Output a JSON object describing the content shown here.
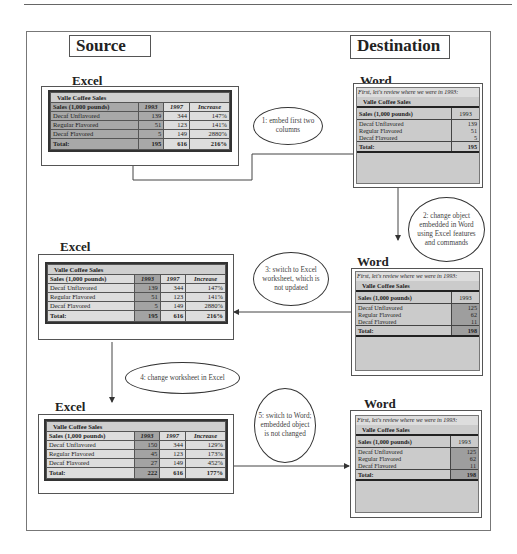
{
  "headers": {
    "source": "Source",
    "destination": "Destination"
  },
  "app_labels": {
    "excel": "Excel",
    "word": "Word"
  },
  "table_title": "Valle Coffee Sales",
  "word_intro": "First, let's review where we were in 1993:",
  "columns": {
    "label": "Sales (1,000 pounds)",
    "y1993": "1993",
    "y1997": "1997",
    "increase": "Increase"
  },
  "total_label": "Total:",
  "excel_tables": [
    {
      "id": "excel-original",
      "rows": [
        {
          "label": "Decaf Unflavored",
          "y1993": "139",
          "y1997": "344",
          "increase": "147%"
        },
        {
          "label": "Regular Flavored",
          "y1993": "51",
          "y1997": "123",
          "increase": "141%"
        },
        {
          "label": "Decaf Flavored",
          "y1993": "5",
          "y1997": "149",
          "increase": "2880%"
        }
      ],
      "total": {
        "y1993": "195",
        "y1997": "616",
        "increase": "216%"
      }
    },
    {
      "id": "excel-not-updated",
      "rows": [
        {
          "label": "Decaf Unflavored",
          "y1993": "139",
          "y1997": "344",
          "increase": "147%"
        },
        {
          "label": "Regular Flavored",
          "y1993": "51",
          "y1997": "123",
          "increase": "141%"
        },
        {
          "label": "Decaf Flavored",
          "y1993": "5",
          "y1997": "149",
          "increase": "2880%"
        }
      ],
      "total": {
        "y1993": "195",
        "y1997": "616",
        "increase": "216%"
      }
    },
    {
      "id": "excel-changed",
      "rows": [
        {
          "label": "Decaf Unflavored",
          "y1993": "150",
          "y1997": "344",
          "increase": "129%"
        },
        {
          "label": "Regular Flavored",
          "y1993": "45",
          "y1997": "123",
          "increase": "173%"
        },
        {
          "label": "Decaf Flavored",
          "y1993": "27",
          "y1997": "149",
          "increase": "452%"
        }
      ],
      "total": {
        "y1993": "222",
        "y1997": "616",
        "increase": "177%"
      }
    }
  ],
  "word_tables": [
    {
      "id": "word-embedded",
      "rows": [
        {
          "label": "Decaf Unflavored",
          "y1993": "139"
        },
        {
          "label": "Regular Flavored",
          "y1993": "51"
        },
        {
          "label": "Decaf Flavored",
          "y1993": "5"
        }
      ],
      "total": "195"
    },
    {
      "id": "word-changed",
      "rows": [
        {
          "label": "Decaf Unflavored",
          "y1993": "125"
        },
        {
          "label": "Regular Flavored",
          "y1993": "62"
        },
        {
          "label": "Decaf Flavored",
          "y1993": "11"
        }
      ],
      "total": "198"
    },
    {
      "id": "word-unchanged",
      "rows": [
        {
          "label": "Decaf Unflavored",
          "y1993": "125"
        },
        {
          "label": "Regular Flavored",
          "y1993": "62"
        },
        {
          "label": "Decaf Flavored",
          "y1993": "11"
        }
      ],
      "total": "198"
    }
  ],
  "steps": [
    {
      "number": "1",
      "text": "1: embed first two columns"
    },
    {
      "number": "2",
      "text": "2: change object embedded in Word using Excel features and commands"
    },
    {
      "number": "3",
      "text": "3: switch to Excel worksheet, which is not updated"
    },
    {
      "number": "4",
      "text": "4: change worksheet in Excel"
    },
    {
      "number": "5",
      "text": "5: switch to Word; embedded object is not changed"
    }
  ]
}
